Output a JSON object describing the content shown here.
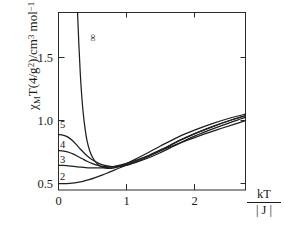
{
  "chart_data": {
    "type": "line",
    "title": "",
    "xlabel": "kT / |J|",
    "xlabel_numerator": "kT",
    "xlabel_denominator": "| J |",
    "ylabel": "χMT(4/g²)/cm³ mol⁻¹ K",
    "xlim": [
      0,
      2.75
    ],
    "ylim": [
      0.45,
      1.86
    ],
    "xticks": [
      0,
      1,
      2
    ],
    "xticklabels": [
      "0",
      "1",
      "2"
    ],
    "yticks": [
      0.5,
      1.0,
      1.5
    ],
    "yticklabels": [
      "0.5",
      "1.0",
      "1.5"
    ],
    "grid": false,
    "legend_position": "inline-curve-labels",
    "series": [
      {
        "name": "∞",
        "label": "∞",
        "label_rotated": true,
        "label_x": 0.52,
        "label_y": 1.66,
        "x": [
          0.28,
          0.3,
          0.32,
          0.34,
          0.36,
          0.39,
          0.42,
          0.46,
          0.5,
          0.55,
          0.6,
          0.66,
          0.72,
          0.8,
          0.9,
          1.0,
          1.15,
          1.3,
          1.5,
          1.75,
          2.0,
          2.25,
          2.5,
          2.75
        ],
        "y": [
          1.86,
          1.6,
          1.38,
          1.21,
          1.08,
          0.94,
          0.84,
          0.76,
          0.71,
          0.67,
          0.645,
          0.628,
          0.622,
          0.624,
          0.638,
          0.66,
          0.7,
          0.742,
          0.8,
          0.868,
          0.925,
          0.975,
          1.018,
          1.052
        ]
      },
      {
        "name": "5",
        "label": "5",
        "label_x": 0.06,
        "label_y": 0.96,
        "x": [
          0.0,
          0.05,
          0.1,
          0.15,
          0.2,
          0.26,
          0.32,
          0.38,
          0.45,
          0.52,
          0.6,
          0.68,
          0.76,
          0.85,
          0.95,
          1.05,
          1.2,
          1.35,
          1.55,
          1.8,
          2.05,
          2.3,
          2.55,
          2.75
        ],
        "y": [
          0.89,
          0.888,
          0.88,
          0.866,
          0.845,
          0.812,
          0.776,
          0.742,
          0.708,
          0.682,
          0.66,
          0.646,
          0.638,
          0.636,
          0.642,
          0.656,
          0.686,
          0.722,
          0.778,
          0.848,
          0.908,
          0.962,
          1.008,
          1.04
        ]
      },
      {
        "name": "4",
        "label": "4",
        "label_x": 0.06,
        "label_y": 0.806,
        "x": [
          0.0,
          0.05,
          0.1,
          0.16,
          0.22,
          0.28,
          0.35,
          0.42,
          0.5,
          0.58,
          0.66,
          0.74,
          0.82,
          0.92,
          1.02,
          1.15,
          1.3,
          1.48,
          1.7,
          1.95,
          2.2,
          2.45,
          2.7,
          2.75
        ],
        "y": [
          0.762,
          0.761,
          0.757,
          0.748,
          0.735,
          0.718,
          0.698,
          0.678,
          0.66,
          0.646,
          0.637,
          0.633,
          0.633,
          0.639,
          0.65,
          0.672,
          0.7,
          0.742,
          0.8,
          0.866,
          0.922,
          0.972,
          1.018,
          1.028
        ]
      },
      {
        "name": "3",
        "label": "3",
        "label_x": 0.06,
        "label_y": 0.686,
        "x": [
          0.0,
          0.06,
          0.12,
          0.18,
          0.25,
          0.32,
          0.4,
          0.48,
          0.56,
          0.64,
          0.72,
          0.82,
          0.92,
          1.04,
          1.18,
          1.34,
          1.55,
          1.78,
          2.02,
          2.28,
          2.52,
          2.75
        ],
        "y": [
          0.645,
          0.645,
          0.643,
          0.64,
          0.636,
          0.632,
          0.628,
          0.626,
          0.625,
          0.626,
          0.63,
          0.638,
          0.65,
          0.668,
          0.694,
          0.728,
          0.782,
          0.844,
          0.902,
          0.956,
          1.002,
          1.04
        ]
      },
      {
        "name": "2",
        "label": "2",
        "label_x": 0.06,
        "label_y": 0.545,
        "x": [
          0.0,
          0.06,
          0.12,
          0.2,
          0.28,
          0.36,
          0.45,
          0.54,
          0.64,
          0.74,
          0.85,
          0.96,
          1.1,
          1.25,
          1.42,
          1.62,
          1.85,
          2.1,
          2.35,
          2.58,
          2.75
        ],
        "y": [
          0.5,
          0.5,
          0.501,
          0.504,
          0.51,
          0.519,
          0.532,
          0.548,
          0.568,
          0.59,
          0.615,
          0.64,
          0.672,
          0.706,
          0.744,
          0.788,
          0.836,
          0.886,
          0.932,
          0.972,
          1.0
        ]
      }
    ]
  },
  "axis": {
    "x_ticks": [
      {
        "label": "0",
        "value": 0
      },
      {
        "label": "1",
        "value": 1
      },
      {
        "label": "2",
        "value": 2
      }
    ],
    "y_ticks": [
      {
        "label": "0.5",
        "value": 0.5
      },
      {
        "label": "1.0",
        "value": 1.0
      },
      {
        "label": "1.5",
        "value": 1.5
      }
    ]
  },
  "ylabel_parts": {
    "chi": "χ",
    "sub_m": "M",
    "t": "T(4/g",
    "sup_2": "2",
    "mid": ")/cm",
    "sup_3": "3",
    "mol": " mol",
    "sup_minus1": "−1",
    "kelvin": " K"
  },
  "xlabel_parts": {
    "numerator": "kT",
    "denominator": "| J |"
  }
}
